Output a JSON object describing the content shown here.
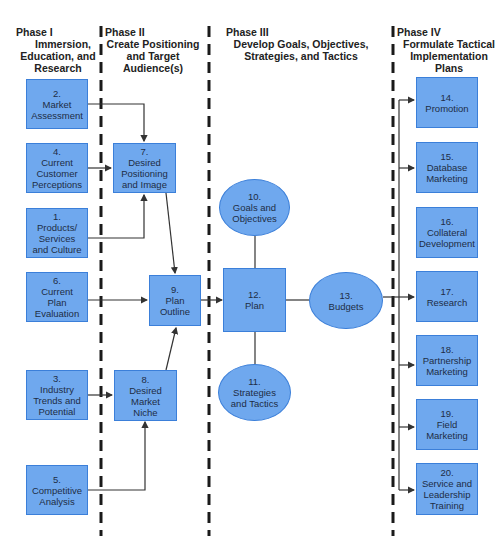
{
  "phases": [
    {
      "label": "Phase I",
      "subtitle": [
        "Immersion,",
        "Education, and",
        "Research"
      ]
    },
    {
      "label": "Phase II",
      "subtitle": [
        "Create Positioning",
        "and Target",
        "Audience(s)"
      ]
    },
    {
      "label": "Phase III",
      "subtitle": [
        "Develop Goals, Objectives,",
        "Strategies, and Tactics"
      ]
    },
    {
      "label": "Phase IV",
      "subtitle": [
        "Formulate Tactical",
        "Implementation",
        "Plans"
      ]
    }
  ],
  "nodes": {
    "n2": {
      "num": "2.",
      "lines": [
        "Market",
        "Assessment"
      ]
    },
    "n4": {
      "num": "4.",
      "lines": [
        "Current",
        "Customer",
        "Perceptions"
      ]
    },
    "n1": {
      "num": "1.",
      "lines": [
        "Products/",
        "Services",
        "and Culture"
      ]
    },
    "n6": {
      "num": "6.",
      "lines": [
        "Current",
        "Plan",
        "Evaluation"
      ]
    },
    "n3": {
      "num": "3.",
      "lines": [
        "Industry",
        "Trends and",
        "Potential"
      ]
    },
    "n5": {
      "num": "5.",
      "lines": [
        "Competitive",
        "Analysis"
      ]
    },
    "n7": {
      "num": "7.",
      "lines": [
        "Desired",
        "Positioning",
        "and Image"
      ]
    },
    "n9": {
      "num": "9.",
      "lines": [
        "Plan",
        "Outline"
      ]
    },
    "n8": {
      "num": "8.",
      "lines": [
        "Desired",
        "Market",
        "Niche"
      ]
    },
    "n10": {
      "num": "10.",
      "lines": [
        "Goals and",
        "Objectives"
      ]
    },
    "n12": {
      "num": "12.",
      "lines": [
        "Plan"
      ]
    },
    "n13": {
      "num": "13.",
      "lines": [
        "Budgets"
      ]
    },
    "n11": {
      "num": "11.",
      "lines": [
        "Strategies",
        "and Tactics"
      ]
    },
    "n14": {
      "num": "14.",
      "lines": [
        "Promotion"
      ]
    },
    "n15": {
      "num": "15.",
      "lines": [
        "Database",
        "Marketing"
      ]
    },
    "n16": {
      "num": "16.",
      "lines": [
        "Collateral",
        "Development"
      ]
    },
    "n17": {
      "num": "17.",
      "lines": [
        "Research"
      ]
    },
    "n18": {
      "num": "18.",
      "lines": [
        "Partnership",
        "Marketing"
      ]
    },
    "n19": {
      "num": "19.",
      "lines": [
        "Field",
        "Marketing"
      ]
    },
    "n20": {
      "num": "20.",
      "lines": [
        "Service and",
        "Leadership",
        "Training"
      ]
    }
  },
  "colors": {
    "node_fill": "#6fa8ee",
    "node_border": "#3b7fd9",
    "line": "#333333",
    "divider": "#1a1a1a"
  }
}
